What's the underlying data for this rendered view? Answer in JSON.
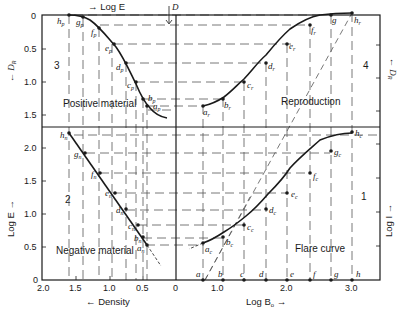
{
  "figure": {
    "quadrants": [
      {
        "id": 3,
        "label": "3",
        "name": "Positive material"
      },
      {
        "id": 4,
        "label": "4",
        "name": "Reproduction"
      },
      {
        "id": 2,
        "label": "2",
        "name": "Negative material"
      },
      {
        "id": 1,
        "label": "1",
        "name": "Flare curve"
      }
    ],
    "axes": {
      "top_label": "Log E",
      "top_arrow": "→",
      "center_top_label": "D",
      "left_upper_label": "D",
      "left_upper_sub": "R",
      "right_upper_label": "D",
      "right_upper_sub": "R",
      "left_lower_label": "Log E",
      "right_lower_label": "Log I",
      "bottom_left_label": "Density",
      "bottom_right_label": "Log B",
      "bottom_right_sub": "o",
      "upper_left_ticks": [
        "0",
        "0.5",
        "1.0",
        "1.5"
      ],
      "lower_left_ticks": [
        "2.0",
        "1.5",
        "1.0",
        "0.5",
        "0"
      ],
      "density_ticks": [
        "2.0",
        "1.5",
        "1.0",
        "0.5",
        "0"
      ],
      "logbo_ticks": [
        "1.0",
        "2.0",
        "3.0"
      ],
      "bottom_points": [
        "a",
        "b",
        "c",
        "d",
        "e",
        "f",
        "g",
        "h"
      ]
    },
    "point_labels": {
      "positive": [
        "h",
        "g",
        "f",
        "e",
        "d",
        "c",
        "b",
        "a"
      ],
      "positive_sub": "p",
      "reproduction": [
        "a",
        "b",
        "c",
        "d",
        "e",
        "f",
        "g",
        "h"
      ],
      "reproduction_sub": "r",
      "negative": [
        "h",
        "g",
        "f",
        "e",
        "d",
        "c",
        "b",
        "a"
      ],
      "negative_sub": "n",
      "flare": [
        "a",
        "b",
        "c",
        "d",
        "e",
        "f",
        "g",
        "h"
      ],
      "flare_sub": "c"
    },
    "colors": {
      "ink": "#1a1a1a",
      "background": "#ffffff"
    }
  }
}
